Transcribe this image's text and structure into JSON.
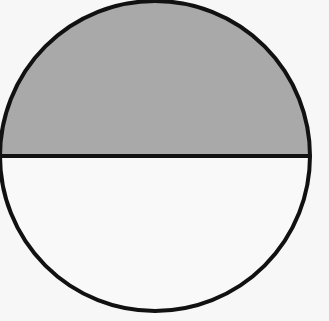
{
  "diagram": {
    "shape": "circle divided by horizontal diameter",
    "background_color": "#f7f7f7",
    "circle": {
      "cx": 155,
      "cy": 156,
      "r": 155,
      "stroke": "#111111",
      "stroke_width": 4
    },
    "top_half": {
      "fill": "#a9a9a9",
      "label": "shaded upper half"
    },
    "bottom_half": {
      "fill": "#f9f9f9",
      "label": "unshaded lower half"
    },
    "divider": {
      "y": 156,
      "stroke": "#111111",
      "stroke_width": 4
    }
  }
}
